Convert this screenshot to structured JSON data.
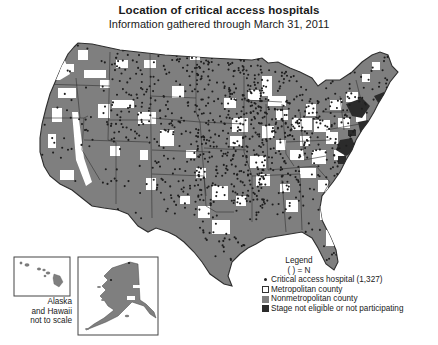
{
  "header": {
    "title": "Location of critical access hospitals",
    "subtitle": "Information gathered through March 31, 2011"
  },
  "legend": {
    "title": "Legend",
    "note": "( ) = N",
    "items": [
      {
        "symbol": "dot",
        "label": "Critical access hospital (1,327)",
        "color": "#222222"
      },
      {
        "symbol": "square",
        "label": "Metropolitan county",
        "color": "#ffffff"
      },
      {
        "symbol": "square",
        "label": "Nonmetropolitan county",
        "color": "#7f7f7f"
      },
      {
        "symbol": "square",
        "label": "Stage not eligible or not participating",
        "color": "#2b2b2b"
      }
    ]
  },
  "insets": {
    "note_line1": "Alaska",
    "note_line2": "and Hawaii",
    "note_line3": "not to scale",
    "hawaii_label": "Hawaii",
    "alaska_label": "Alaska"
  },
  "colors": {
    "nonmetro": "#7f7f7f",
    "metro": "#ffffff",
    "not_participating": "#2b2b2b",
    "hospital_dot": "#1e1e1e",
    "border": "#3a3a3a"
  },
  "stats": {
    "critical_access_hospitals": 1327
  }
}
